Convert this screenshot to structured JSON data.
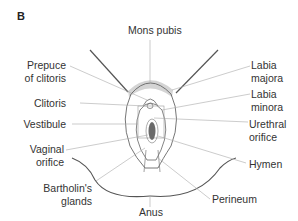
{
  "figure": {
    "panel_label": "B",
    "labels": {
      "mons_pubis": "Mons pubis",
      "prepuce_line1": "Prepuce",
      "prepuce_line2": "of clitoris",
      "clitoris": "Clitoris",
      "vestibule": "Vestibule",
      "vaginal_line1": "Vaginal",
      "vaginal_line2": "orifice",
      "bartholin_line1": "Bartholin's",
      "bartholin_line2": "glands",
      "anus": "Anus",
      "labia_majora_line1": "Labia",
      "labia_majora_line2": "majora",
      "labia_minora_line1": "Labia",
      "labia_minora_line2": "minora",
      "urethral_line1": "Urethral",
      "urethral_line2": "orifice",
      "hymen": "Hymen",
      "perineum": "Perineum"
    },
    "colors": {
      "outline": "#555555",
      "leader": "#aaaaaa",
      "shading": "#d4d4d4",
      "orifice": "#6a6a6a"
    }
  }
}
